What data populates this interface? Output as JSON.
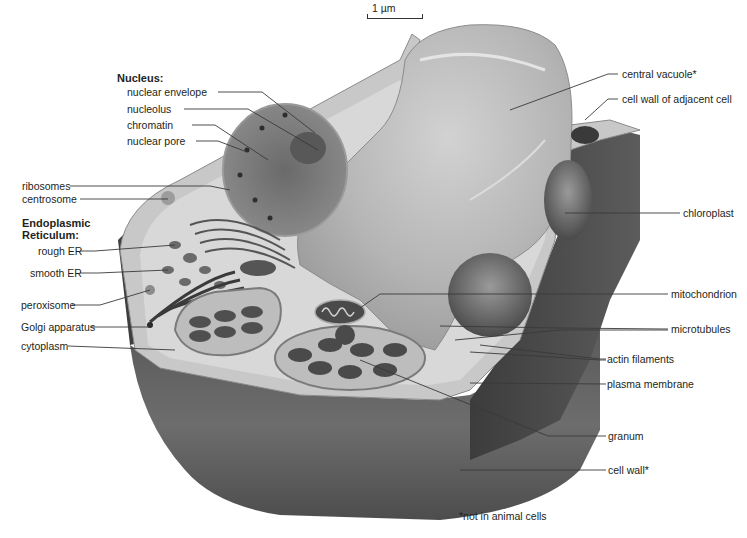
{
  "scale_bar": {
    "label": "1 µm"
  },
  "groups": {
    "nucleus": "Nucleus:",
    "endoplasmic_reticulum": "Endoplasmic\nReticulum:"
  },
  "left_labels": [
    {
      "id": "nuclear-envelope",
      "text": "nuclear envelope"
    },
    {
      "id": "nucleolus",
      "text": "nucleolus"
    },
    {
      "id": "chromatin",
      "text": "chromatin"
    },
    {
      "id": "nuclear-pore",
      "text": "nuclear pore"
    },
    {
      "id": "ribosomes",
      "text": "ribosomes"
    },
    {
      "id": "centrosome",
      "text": "centrosome"
    },
    {
      "id": "rough-er",
      "text": "rough ER"
    },
    {
      "id": "smooth-er",
      "text": "smooth ER"
    },
    {
      "id": "peroxisome",
      "text": "peroxisome"
    },
    {
      "id": "golgi-apparatus",
      "text": "Golgi apparatus"
    },
    {
      "id": "cytoplasm",
      "text": "cytoplasm"
    }
  ],
  "right_labels": [
    {
      "id": "central-vacuole",
      "text": "central vacuole*"
    },
    {
      "id": "cell-wall-adjacent",
      "text": "cell wall of adjacent cell"
    },
    {
      "id": "chloroplast",
      "text": "chloroplast"
    },
    {
      "id": "mitochondrion",
      "text": "mitochondrion"
    },
    {
      "id": "microtubules",
      "text": "microtubules"
    },
    {
      "id": "actin-filaments",
      "text": "actin filaments"
    },
    {
      "id": "plasma-membrane",
      "text": "plasma membrane"
    },
    {
      "id": "granum",
      "text": "granum"
    },
    {
      "id": "cell-wall",
      "text": "cell wall*"
    }
  ],
  "footnote": "*not in animal cells",
  "colors": {
    "background": "#ffffff",
    "wall_dark": "#4a4a4a",
    "wall_mid": "#6e6e6e",
    "wall_light": "#bdbdbd",
    "cytoplasm": "#d4d4d4",
    "vacuole": "#b9b9b9",
    "nucleus": "#7a7a7a",
    "leader_line": "#3a3a3a"
  }
}
